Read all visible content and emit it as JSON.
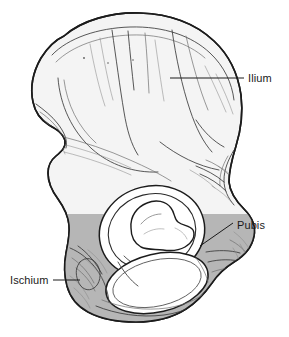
{
  "figure": {
    "background_color": "#ffffff",
    "outline_color": "#1c1c1c",
    "ilium_fill": "#f4f4f4",
    "ischium_pubis_fill": "#b6b6b6",
    "void_fill": "#ffffff",
    "label_color": "#1a1a1a"
  },
  "labels": [
    {
      "id": "ilium",
      "text": "Ilium",
      "text_x": 248,
      "text_y": 82,
      "leader_from_x": 170,
      "leader_from_y": 78,
      "leader_to_x": 244,
      "leader_to_y": 78,
      "anchor": "start"
    },
    {
      "id": "pubis",
      "text": "Pubis",
      "text_x": 237,
      "text_y": 229,
      "leader_from_x": 200,
      "leader_from_y": 246,
      "leader_to_x": 233,
      "leader_to_y": 223,
      "anchor": "start"
    },
    {
      "id": "ischium",
      "text": "Ischium",
      "text_x": 10,
      "text_y": 284,
      "leader_from_x": 80,
      "leader_from_y": 280,
      "leader_to_x": 53,
      "leader_to_y": 280,
      "anchor": "start"
    }
  ],
  "regions": [
    {
      "id": "ilium-body",
      "name": "Ilium",
      "shade": "light"
    },
    {
      "id": "ischium-body",
      "name": "Ischium",
      "shade": "medium-gray"
    },
    {
      "id": "pubis-body",
      "name": "Pubis",
      "shade": "medium-gray"
    },
    {
      "id": "acetabulum",
      "name": "Acetabulum",
      "shade": "void"
    },
    {
      "id": "obturator-foramen",
      "name": "Obturator foramen",
      "shade": "void"
    }
  ]
}
